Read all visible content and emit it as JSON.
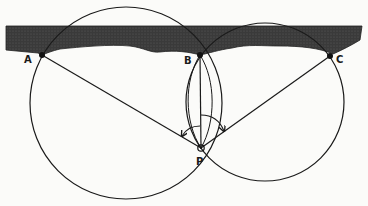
{
  "figure": {
    "type": "three-point resection diagram",
    "labels": {
      "a": "A",
      "b": "B",
      "c": "C",
      "p": "P"
    },
    "colors": {
      "ink": "#1a1a1a",
      "coast_fill": "#3a3a3a",
      "background": "#fbfbf9"
    },
    "points": {
      "A": [
        42,
        55
      ],
      "B": [
        200,
        55
      ],
      "C": [
        330,
        56
      ],
      "P": [
        201,
        148
      ]
    },
    "circles": [
      {
        "name": "circle-ABP",
        "center": [
          126,
          103
        ],
        "r": 96
      },
      {
        "name": "circle-BCP",
        "center": [
          265,
          102
        ],
        "r": 79
      }
    ]
  }
}
